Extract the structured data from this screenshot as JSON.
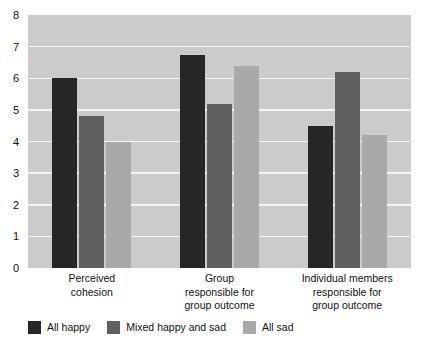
{
  "chart_data": {
    "type": "bar",
    "title": "",
    "subtitle": "",
    "xlabel": "",
    "ylabel": "",
    "ylim": [
      0,
      8
    ],
    "ytick_labels": [
      "8",
      "7",
      "6",
      "5",
      "4",
      "3",
      "2",
      "1",
      "0"
    ],
    "yticks": [
      8,
      7,
      6,
      5,
      4,
      3,
      2,
      1,
      0
    ],
    "grid": true,
    "legend_position": "below-left",
    "categories": [
      "Perceived cohesion",
      "Group responsible for group outcome",
      "Individual members responsible for group outcome"
    ],
    "category_label_lines": [
      [
        "Perceived",
        "cohesion"
      ],
      [
        "Group",
        "responsible for",
        "group outcome"
      ],
      [
        "Individual members",
        "responsible for",
        "group outcome"
      ]
    ],
    "series": [
      {
        "name": "All happy",
        "color": "#262626",
        "values": [
          6.0,
          6.75,
          4.5
        ]
      },
      {
        "name": "Mixed happy and sad",
        "color": "#606060",
        "values": [
          4.8,
          5.2,
          6.2
        ]
      },
      {
        "name": "All sad",
        "color": "#a9a9a9",
        "values": [
          4.0,
          6.4,
          4.2
        ]
      }
    ],
    "plot_background_color": "#cbcbcb",
    "gridline_color": "#f4f4f4",
    "page_background_color": "#ffffff"
  },
  "legend": {
    "items": [
      {
        "label": "All happy",
        "swatch_name": "legend-swatch-all-happy"
      },
      {
        "label": "Mixed happy and sad",
        "swatch_name": "legend-swatch-mixed-happy-and-sad"
      },
      {
        "label": "All sad",
        "swatch_name": "legend-swatch-all-sad"
      }
    ]
  }
}
